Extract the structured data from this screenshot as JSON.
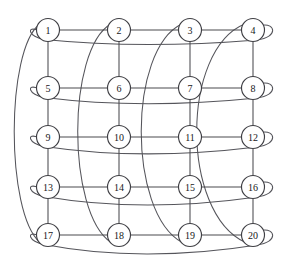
{
  "figure": {
    "background_color": "#ffffff",
    "edge_color": "#4a4a4f",
    "wrap_edge_color": "#55555b",
    "node_fill": "#ffffff",
    "node_stroke": "#3f3f44",
    "label_color": "#17171a",
    "rows": 5,
    "columns": 4,
    "node_radius": 11.5
  },
  "graph_data": {
    "type": "graph",
    "layout": "grid-torus",
    "node_count": 20,
    "nodes": [
      {
        "id": 1,
        "label": "1",
        "row": 0,
        "col": 0,
        "cx": 48,
        "cy": 30
      },
      {
        "id": 2,
        "label": "2",
        "row": 0,
        "col": 1,
        "cx": 119,
        "cy": 30
      },
      {
        "id": 3,
        "label": "3",
        "row": 0,
        "col": 2,
        "cx": 190,
        "cy": 30
      },
      {
        "id": 4,
        "label": "4",
        "row": 0,
        "col": 3,
        "cx": 253,
        "cy": 30
      },
      {
        "id": 5,
        "label": "5",
        "row": 1,
        "col": 0,
        "cx": 48,
        "cy": 88
      },
      {
        "id": 6,
        "label": "6",
        "row": 1,
        "col": 1,
        "cx": 119,
        "cy": 88
      },
      {
        "id": 7,
        "label": "7",
        "row": 1,
        "col": 2,
        "cx": 190,
        "cy": 88
      },
      {
        "id": 8,
        "label": "8",
        "row": 1,
        "col": 3,
        "cx": 253,
        "cy": 88
      },
      {
        "id": 9,
        "label": "9",
        "row": 2,
        "col": 0,
        "cx": 48,
        "cy": 137
      },
      {
        "id": 10,
        "label": "10",
        "row": 2,
        "col": 1,
        "cx": 119,
        "cy": 137
      },
      {
        "id": 11,
        "label": "11",
        "row": 2,
        "col": 2,
        "cx": 190,
        "cy": 137
      },
      {
        "id": 12,
        "label": "12",
        "row": 2,
        "col": 3,
        "cx": 253,
        "cy": 137
      },
      {
        "id": 13,
        "label": "13",
        "row": 3,
        "col": 0,
        "cx": 48,
        "cy": 187
      },
      {
        "id": 14,
        "label": "14",
        "row": 3,
        "col": 1,
        "cx": 119,
        "cy": 187
      },
      {
        "id": 15,
        "label": "15",
        "row": 3,
        "col": 2,
        "cx": 190,
        "cy": 187
      },
      {
        "id": 16,
        "label": "16",
        "row": 3,
        "col": 3,
        "cx": 253,
        "cy": 187
      },
      {
        "id": 17,
        "label": "17",
        "row": 4,
        "col": 0,
        "cx": 48,
        "cy": 235
      },
      {
        "id": 18,
        "label": "18",
        "row": 4,
        "col": 1,
        "cx": 119,
        "cy": 235
      },
      {
        "id": 19,
        "label": "19",
        "row": 4,
        "col": 2,
        "cx": 190,
        "cy": 235
      },
      {
        "id": 20,
        "label": "20",
        "row": 4,
        "col": 3,
        "cx": 253,
        "cy": 235
      }
    ],
    "straight_edges": [
      [
        1,
        2
      ],
      [
        2,
        3
      ],
      [
        3,
        4
      ],
      [
        5,
        6
      ],
      [
        6,
        7
      ],
      [
        7,
        8
      ],
      [
        9,
        10
      ],
      [
        10,
        11
      ],
      [
        11,
        12
      ],
      [
        13,
        14
      ],
      [
        14,
        15
      ],
      [
        15,
        16
      ],
      [
        17,
        18
      ],
      [
        18,
        19
      ],
      [
        19,
        20
      ],
      [
        1,
        5
      ],
      [
        5,
        9
      ],
      [
        9,
        13
      ],
      [
        13,
        17
      ],
      [
        2,
        6
      ],
      [
        6,
        10
      ],
      [
        10,
        14
      ],
      [
        14,
        18
      ],
      [
        3,
        7
      ],
      [
        7,
        11
      ],
      [
        11,
        15
      ],
      [
        15,
        19
      ],
      [
        4,
        8
      ],
      [
        8,
        12
      ],
      [
        12,
        16
      ],
      [
        16,
        20
      ]
    ],
    "row_wrap_edges": [
      {
        "from": 4,
        "to": 1,
        "row": 0
      },
      {
        "from": 8,
        "to": 5,
        "row": 1
      },
      {
        "from": 12,
        "to": 9,
        "row": 2
      },
      {
        "from": 16,
        "to": 13,
        "row": 3
      },
      {
        "from": 20,
        "to": 17,
        "row": 4
      }
    ],
    "column_wrap_edges": [
      {
        "from": 1,
        "to": 17,
        "col": 0
      },
      {
        "from": 2,
        "to": 18,
        "col": 1
      },
      {
        "from": 3,
        "to": 19,
        "col": 2
      },
      {
        "from": 4,
        "to": 20,
        "col": 3
      }
    ]
  }
}
